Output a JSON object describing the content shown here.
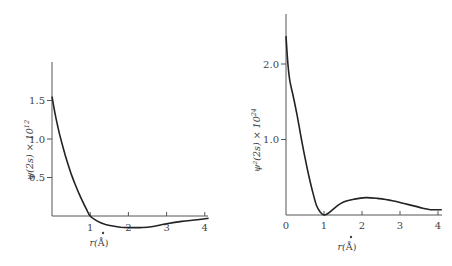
{
  "chart_data": [
    {
      "type": "line",
      "title": "",
      "xlabel": "r(Å)",
      "ylabel": "ψ(2s) × 10^12",
      "x_ticks": [
        "1",
        "2",
        "3",
        "4"
      ],
      "y_ticks": [
        "0.5",
        "1.0",
        "1.5"
      ],
      "xlim": [
        0,
        4.1
      ],
      "ylim": [
        -0.18,
        1.95
      ],
      "grid": false,
      "legend": null,
      "series": [
        {
          "name": "psi_2s",
          "x": [
            0,
            0.1,
            0.2,
            0.3,
            0.4,
            0.5,
            0.6,
            0.7,
            0.8,
            0.9,
            1.0,
            1.2,
            1.4,
            1.6,
            1.8,
            2.0,
            2.3,
            2.6,
            3.0,
            3.4,
            3.8,
            4.1
          ],
          "y": [
            1.55,
            1.28,
            1.06,
            0.87,
            0.7,
            0.55,
            0.42,
            0.3,
            0.19,
            0.09,
            0.0,
            -0.07,
            -0.11,
            -0.13,
            -0.145,
            -0.15,
            -0.15,
            -0.14,
            -0.1,
            -0.07,
            -0.05,
            -0.03
          ]
        }
      ]
    },
    {
      "type": "line",
      "title": "",
      "xlabel": "r(Å)",
      "ylabel": "ψ²(2s) × 10^24",
      "x_ticks": [
        "0",
        "1",
        "2",
        "3",
        "4"
      ],
      "y_ticks": [
        "1.0",
        "2.0"
      ],
      "xlim": [
        0,
        4.1
      ],
      "ylim": [
        0,
        2.65
      ],
      "grid": false,
      "legend": null,
      "series": [
        {
          "name": "psi_2s_squared",
          "x": [
            0,
            0.05,
            0.1,
            0.2,
            0.3,
            0.4,
            0.5,
            0.6,
            0.7,
            0.8,
            0.9,
            1.0,
            1.1,
            1.3,
            1.5,
            1.8,
            2.1,
            2.4,
            2.8,
            3.2,
            3.6,
            3.8,
            4.1
          ],
          "y": [
            2.37,
            2.0,
            1.78,
            1.55,
            1.3,
            1.02,
            0.76,
            0.52,
            0.31,
            0.13,
            0.04,
            0.0,
            0.02,
            0.1,
            0.17,
            0.21,
            0.23,
            0.22,
            0.19,
            0.14,
            0.09,
            0.07,
            0.07
          ]
        }
      ]
    }
  ],
  "left_chart": {
    "ylabel_main": "ψ(2s) × 10",
    "ylabel_exp": "12",
    "xlabel_main": "r(",
    "xlabel_unit": "Å",
    "xlabel_close": ")",
    "x_ticks": [
      "1",
      "2",
      "3",
      "4"
    ],
    "y_ticks": [
      "0.5",
      "1.0",
      "1.5"
    ]
  },
  "right_chart": {
    "ylabel_main": "ψ²(2s) × 10",
    "ylabel_exp": "24",
    "xlabel_main": "r(",
    "xlabel_unit": "Å",
    "xlabel_close": ")",
    "x_ticks": [
      "0",
      "1",
      "2",
      "3",
      "4"
    ],
    "y_ticks": [
      "1.0",
      "2.0"
    ]
  }
}
